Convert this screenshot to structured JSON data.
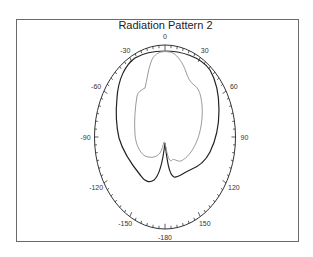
{
  "chart_data": {
    "type": "polar-line",
    "title": "Radiation Pattern 2",
    "angle_ticks": [
      "0",
      "30",
      "60",
      "90",
      "120",
      "150",
      "-180",
      "-150",
      "-120",
      "-90",
      "-60",
      "-30"
    ],
    "angle_tick_degrees": [
      0,
      30,
      60,
      90,
      120,
      150,
      180,
      -150,
      -120,
      -90,
      -60,
      -30
    ],
    "grid": false,
    "legend": null,
    "series": [
      {
        "name": "pattern-dark",
        "color": "#222222",
        "description": "Outer dark pattern: broad upper lobe, deep null near 180 deg, side lobes at about ±160 deg",
        "points_approx_deg_radiusfrac": [
          [
            0,
            0.93
          ],
          [
            30,
            0.92
          ],
          [
            60,
            0.86
          ],
          [
            90,
            0.77
          ],
          [
            120,
            0.7
          ],
          [
            140,
            0.58
          ],
          [
            160,
            0.48
          ],
          [
            175,
            0.12
          ],
          [
            180,
            0.1
          ],
          [
            -175,
            0.14
          ],
          [
            -160,
            0.5
          ],
          [
            -140,
            0.65
          ],
          [
            -120,
            0.74
          ],
          [
            -90,
            0.78
          ],
          [
            -60,
            0.84
          ],
          [
            -30,
            0.92
          ]
        ]
      },
      {
        "name": "pattern-gray",
        "color": "#9a9a9a",
        "description": "Inner gray pattern with shoulders near ±45 deg and null near 180 deg",
        "points_approx_deg_radiusfrac": [
          [
            0,
            0.92
          ],
          [
            20,
            0.88
          ],
          [
            45,
            0.6
          ],
          [
            60,
            0.55
          ],
          [
            90,
            0.52
          ],
          [
            120,
            0.45
          ],
          [
            150,
            0.33
          ],
          [
            170,
            0.2
          ],
          [
            180,
            0.1
          ],
          [
            -170,
            0.22
          ],
          [
            -150,
            0.33
          ],
          [
            -120,
            0.45
          ],
          [
            -90,
            0.45
          ],
          [
            -60,
            0.5
          ],
          [
            -45,
            0.58
          ],
          [
            -20,
            0.86
          ]
        ]
      }
    ]
  }
}
